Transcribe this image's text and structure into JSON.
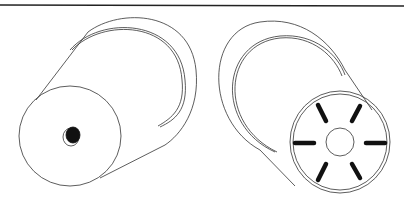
{
  "figure": {
    "type": "patent-style line drawing",
    "colors": {
      "background": "#ffffff",
      "line": "#333333",
      "fill_dark": "#111111"
    },
    "objects": [
      {
        "name": "left-cylinder",
        "end_face": "plain disc with small central dark hole"
      },
      {
        "name": "right-cylinder",
        "end_face": "disc with six radial dark slots around a central circle"
      }
    ]
  }
}
